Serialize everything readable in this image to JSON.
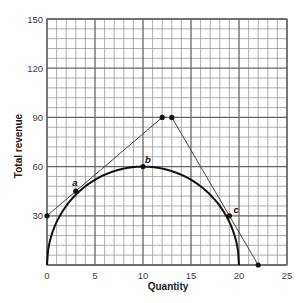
{
  "chart_data": {
    "type": "line",
    "title": "",
    "xlabel": "Quantity",
    "ylabel": "Total revenue",
    "xlim": [
      0,
      25
    ],
    "ylim": [
      0,
      150
    ],
    "x_ticks": [
      0,
      5,
      10,
      15,
      20,
      25
    ],
    "y_ticks": [
      30,
      60,
      90,
      120,
      150
    ],
    "x_tick_labels": [
      "0",
      "5",
      "10",
      "15",
      "20",
      "25"
    ],
    "y_tick_labels": [
      "30",
      "60",
      "90",
      "120",
      "150"
    ],
    "grid": {
      "on": true,
      "x_minor_step": 1,
      "y_minor_step": 6,
      "x_major_step": 5,
      "y_major_step": 30
    },
    "legend": null,
    "series": [
      {
        "name": "Total revenue curve",
        "kind": "curve",
        "points": [
          [
            0,
            0
          ],
          [
            0.5,
            18.7
          ],
          [
            1,
            26.2
          ],
          [
            2,
            36
          ],
          [
            3,
            42.8
          ],
          [
            4,
            48
          ],
          [
            5,
            52
          ],
          [
            6,
            55
          ],
          [
            7,
            57.2
          ],
          [
            8,
            58.8
          ],
          [
            9,
            59.7
          ],
          [
            10,
            60
          ],
          [
            11,
            59.7
          ],
          [
            12,
            58.8
          ],
          [
            13,
            57.2
          ],
          [
            14,
            55
          ],
          [
            15,
            52
          ],
          [
            16,
            48
          ],
          [
            17,
            42.8
          ],
          [
            18,
            36
          ],
          [
            19,
            26.2
          ],
          [
            19.5,
            18.7
          ],
          [
            20,
            0
          ]
        ]
      },
      {
        "name": "Tangent through a",
        "kind": "line",
        "points": [
          [
            0,
            30
          ],
          [
            3,
            45
          ],
          [
            12,
            90
          ]
        ]
      },
      {
        "name": "Tangent through c",
        "kind": "line",
        "points": [
          [
            13,
            90
          ],
          [
            19,
            30
          ],
          [
            22,
            0
          ]
        ]
      }
    ],
    "markers": [
      {
        "x": 0,
        "y": 30,
        "label": ""
      },
      {
        "x": 3,
        "y": 45,
        "label": "a"
      },
      {
        "x": 10,
        "y": 60,
        "label": "b"
      },
      {
        "x": 12,
        "y": 90,
        "label": ""
      },
      {
        "x": 13,
        "y": 90,
        "label": ""
      },
      {
        "x": 19,
        "y": 30,
        "label": "c"
      },
      {
        "x": 22,
        "y": 0,
        "label": ""
      }
    ],
    "annotations": [
      "a",
      "b",
      "c"
    ]
  }
}
